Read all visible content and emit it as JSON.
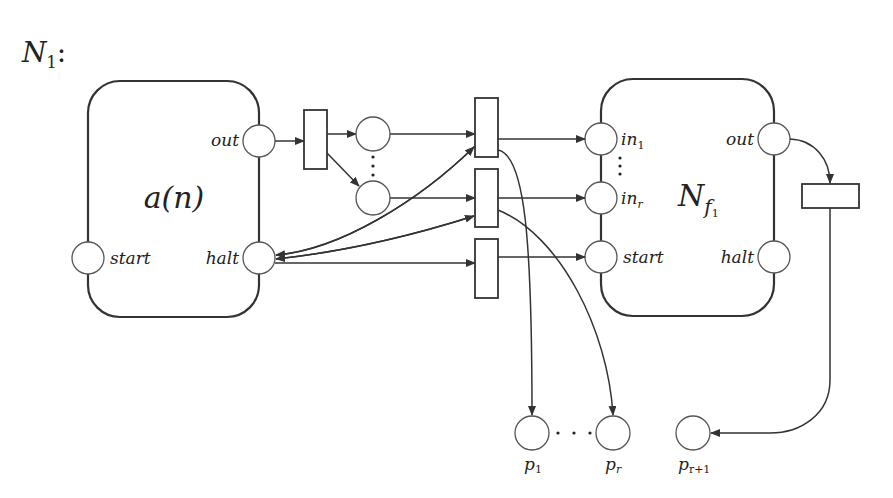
{
  "title": {
    "main": "N",
    "sub": "1",
    "suffix": ":"
  },
  "module_a": {
    "label_main": "a(n)",
    "ports": {
      "out": "out",
      "halt": "halt",
      "start": "start"
    }
  },
  "module_nf": {
    "label_main": "N",
    "label_sub": "f",
    "label_subsub": "1",
    "ports": {
      "in1": "in",
      "in1_sub": "1",
      "inr": "in",
      "inr_sub": "r",
      "start": "start",
      "out": "out",
      "halt": "halt"
    }
  },
  "places": [
    {
      "id": "p1",
      "label": "p",
      "sub": "1"
    },
    {
      "id": "pr",
      "label": "p",
      "sub": "r"
    },
    {
      "id": "pr1",
      "label": "p",
      "sub": "r+1"
    }
  ],
  "colors": {
    "stroke": "#333333",
    "background": "#ffffff"
  }
}
